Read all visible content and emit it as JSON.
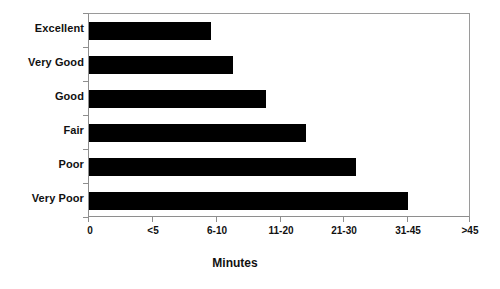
{
  "chart_data": {
    "type": "bar",
    "orientation": "horizontal",
    "title": "",
    "xlabel": "Minutes",
    "ylabel": "",
    "categories": [
      "Excellent",
      "Very Good",
      "Good",
      "Fair",
      "Poor",
      "Very Poor"
    ],
    "values": [
      5.0,
      7.0,
      10.0,
      14.5,
      22.5,
      31.0
    ],
    "x_tick_labels": [
      "0",
      "<5",
      "6-10",
      "11-20",
      "21-30",
      "31-45",
      ">45"
    ],
    "x_tick_values": [
      0,
      5,
      10,
      20,
      30,
      45,
      60
    ],
    "xlim": [
      0,
      7
    ],
    "grid": false,
    "legend": "none",
    "bar_color": "#000000",
    "frame_color": "#8e8e8e",
    "background": "#ffffff",
    "bar_pixel_lengths": [
      122,
      144,
      177,
      217,
      267,
      319
    ],
    "plot_pixel_width": 382
  }
}
